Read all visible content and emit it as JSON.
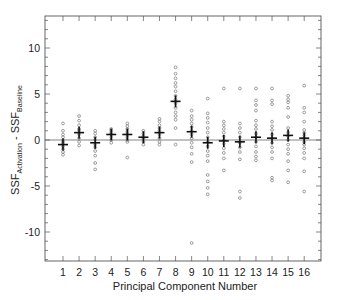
{
  "chart_data": {
    "type": "scatter",
    "title": "",
    "xlabel": "Principal Component Number",
    "ylabel": "SSF_Activation - SSF_Baseline",
    "ylabel_parts": {
      "main1": "SSF",
      "sub1": "Activation",
      "sep": " - ",
      "main2": "SSF",
      "sub2": "Baseline"
    },
    "xlim": [
      0,
      17
    ],
    "ylim": [
      -13.2,
      13.5
    ],
    "x_ticks": [
      1,
      2,
      3,
      4,
      5,
      6,
      7,
      8,
      9,
      10,
      11,
      12,
      13,
      14,
      15,
      16
    ],
    "y_ticks": [
      -10,
      -5,
      0,
      5,
      10
    ],
    "y_minor_step": 1,
    "grid": false,
    "reference_line": 0,
    "marker": "open-circle",
    "mean_marker": "cross",
    "series": [
      {
        "pc": 1,
        "mean": -0.5,
        "values": [
          1.8,
          1.0,
          0.6,
          0.3,
          0.0,
          -0.2,
          -0.4,
          -0.7,
          -1.0,
          -1.3,
          -1.6
        ]
      },
      {
        "pc": 2,
        "mean": 0.8,
        "values": [
          2.6,
          2.1,
          1.6,
          1.2,
          1.0,
          0.6,
          0.2,
          -0.2,
          -0.6
        ]
      },
      {
        "pc": 3,
        "mean": -0.3,
        "values": [
          1.0,
          0.7,
          0.3,
          0.0,
          -0.5,
          -0.8,
          -1.2,
          -1.7,
          -2.5,
          -3.2
        ]
      },
      {
        "pc": 4,
        "mean": 0.6,
        "values": [
          1.2,
          1.0,
          0.8,
          0.6,
          0.3,
          0.0,
          -0.3
        ]
      },
      {
        "pc": 5,
        "mean": 0.6,
        "values": [
          1.8,
          1.5,
          1.2,
          0.9,
          0.6,
          0.3,
          0.0,
          -0.2,
          -1.9
        ]
      },
      {
        "pc": 6,
        "mean": 0.3,
        "values": [
          1.0,
          0.7,
          0.4,
          0.1,
          -0.2,
          -0.5
        ]
      },
      {
        "pc": 7,
        "mean": 0.8,
        "values": [
          2.3,
          2.0,
          1.6,
          1.3,
          1.0,
          0.6,
          0.2,
          -0.2,
          -0.5
        ]
      },
      {
        "pc": 8,
        "mean": 4.2,
        "values": [
          7.9,
          7.2,
          6.7,
          6.2,
          5.8,
          5.3,
          4.8,
          4.4,
          4.0,
          3.5,
          3.0,
          2.6,
          2.2,
          1.3,
          -0.5
        ]
      },
      {
        "pc": 9,
        "mean": 0.9,
        "values": [
          3.2,
          2.6,
          2.2,
          1.8,
          1.4,
          1.0,
          0.6,
          0.2,
          -0.3,
          -0.8,
          -1.5,
          -2.4,
          -11.2
        ]
      },
      {
        "pc": 10,
        "mean": -0.3,
        "values": [
          4.5,
          2.9,
          2.4,
          1.9,
          1.3,
          0.8,
          0.3,
          -0.2,
          -0.7,
          -1.2,
          -1.7,
          -2.3,
          -3.8,
          -4.5,
          -5.2,
          -5.9
        ]
      },
      {
        "pc": 11,
        "mean": -0.1,
        "values": [
          5.6,
          2.0,
          1.6,
          1.2,
          0.8,
          0.4,
          0.0,
          -0.4,
          -0.9,
          -1.4,
          -2.0,
          -3.3
        ]
      },
      {
        "pc": 12,
        "mean": -0.2,
        "values": [
          5.6,
          1.8,
          1.3,
          0.8,
          0.3,
          -0.3,
          -0.8,
          -1.3,
          -2.1,
          -5.6,
          -6.3
        ]
      },
      {
        "pc": 13,
        "mean": 0.3,
        "values": [
          5.6,
          4.3,
          3.8,
          3.2,
          2.1,
          1.6,
          1.2,
          0.7,
          0.3,
          -0.2,
          -0.7,
          -1.3,
          -1.8,
          -2.2
        ]
      },
      {
        "pc": 14,
        "mean": 0.2,
        "values": [
          5.6,
          4.3,
          3.9,
          2.0,
          1.5,
          1.1,
          0.6,
          0.2,
          -0.3,
          -0.8,
          -1.3,
          -2.0,
          -4.1,
          -4.4
        ]
      },
      {
        "pc": 15,
        "mean": 0.5,
        "values": [
          4.8,
          4.4,
          4.1,
          3.5,
          2.5,
          1.3,
          0.8,
          0.4,
          0.0,
          -0.5,
          -1.0,
          -1.5,
          -2.3,
          -3.3,
          -4.6
        ]
      },
      {
        "pc": 16,
        "mean": 0.2,
        "values": [
          5.9,
          3.5,
          3.0,
          2.0,
          1.1,
          0.8,
          0.5,
          0.2,
          -0.2,
          -0.5,
          -0.9,
          -1.4,
          -2.0,
          -3.4,
          -5.6
        ]
      }
    ],
    "colors": {
      "frame": "#555555",
      "points": "#777777",
      "mean": "#111111",
      "zero_line": "#666666",
      "text": "#222222"
    }
  }
}
